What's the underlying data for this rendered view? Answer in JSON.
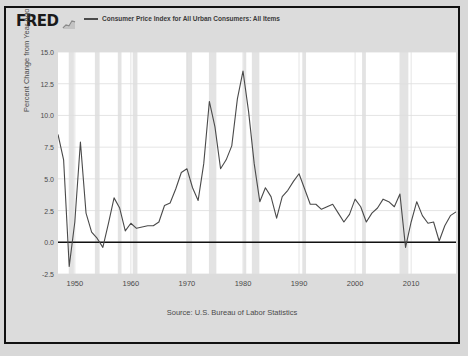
{
  "header": {
    "logo_text": "FRED",
    "logo_glyph": "chart-glyph",
    "series_label": "Consumer Price Index for All Urban Consumers: All Items"
  },
  "source": {
    "text": "Source: U.S. Bureau of Labor Statistics"
  },
  "colors": {
    "line": "#4a4a4a",
    "zero_line": "#111111",
    "grid": "#dddddd",
    "recession_band": "#e3e3e3",
    "plot_bg": "#ffffff",
    "figure_bg": "#dcdcdc",
    "text": "#4a4a4a"
  },
  "chart_data": {
    "type": "line",
    "title": "Consumer Price Index for All Urban Consumers: All Items",
    "xlabel": "",
    "ylabel": "Percent Change from Year Ago",
    "xlim": [
      1947,
      2018
    ],
    "ylim": [
      -2.5,
      15.0
    ],
    "ytick_labels": [
      "15.0",
      "12.5",
      "10.0",
      "7.5",
      "5.0",
      "2.5",
      "0.0",
      "-2.5"
    ],
    "ytick_values": [
      15.0,
      12.5,
      10.0,
      7.5,
      5.0,
      2.5,
      0.0,
      -2.5
    ],
    "xtick_labels": [
      "1950",
      "1960",
      "1970",
      "1980",
      "1990",
      "2000",
      "2010"
    ],
    "xtick_values": [
      1950,
      1960,
      1970,
      1980,
      1990,
      2000,
      2010
    ],
    "grid": true,
    "legend_position": "top",
    "zero_line": 0.0,
    "series": [
      {
        "name": "Consumer Price Index for All Urban Consumers: All Items",
        "x": [
          1947,
          1948,
          1949,
          1950,
          1951,
          1952,
          1953,
          1954,
          1955,
          1956,
          1957,
          1958,
          1959,
          1960,
          1961,
          1962,
          1963,
          1964,
          1965,
          1966,
          1967,
          1968,
          1969,
          1970,
          1971,
          1972,
          1973,
          1974,
          1975,
          1976,
          1977,
          1978,
          1979,
          1980,
          1981,
          1982,
          1983,
          1984,
          1985,
          1986,
          1987,
          1988,
          1989,
          1990,
          1991,
          1992,
          1993,
          1994,
          1995,
          1996,
          1997,
          1998,
          1999,
          2000,
          2001,
          2002,
          2003,
          2004,
          2005,
          2006,
          2007,
          2008,
          2009,
          2010,
          2011,
          2012,
          2013,
          2014,
          2015,
          2016,
          2017,
          2018
        ],
        "values": [
          8.5,
          6.5,
          -1.9,
          1.6,
          7.9,
          2.3,
          0.8,
          0.3,
          -0.4,
          1.5,
          3.5,
          2.7,
          0.9,
          1.5,
          1.1,
          1.2,
          1.3,
          1.3,
          1.6,
          2.9,
          3.1,
          4.2,
          5.5,
          5.8,
          4.3,
          3.3,
          6.2,
          11.1,
          9.1,
          5.8,
          6.5,
          7.6,
          11.3,
          13.5,
          10.3,
          6.2,
          3.2,
          4.3,
          3.6,
          1.9,
          3.6,
          4.1,
          4.8,
          5.4,
          4.2,
          3.0,
          3.0,
          2.6,
          2.8,
          3.0,
          2.3,
          1.6,
          2.2,
          3.4,
          2.8,
          1.6,
          2.3,
          2.7,
          3.4,
          3.2,
          2.8,
          3.8,
          -0.4,
          1.6,
          3.2,
          2.1,
          1.5,
          1.6,
          0.1,
          1.3,
          2.1,
          2.4
        ]
      }
    ],
    "recessions": [
      {
        "start": 1948.92,
        "end": 1949.83
      },
      {
        "start": 1953.58,
        "end": 1954.42
      },
      {
        "start": 1957.67,
        "end": 1958.33
      },
      {
        "start": 1960.33,
        "end": 1961.17
      },
      {
        "start": 1969.92,
        "end": 1970.92
      },
      {
        "start": 1973.92,
        "end": 1975.25
      },
      {
        "start": 1980.08,
        "end": 1980.58
      },
      {
        "start": 1981.58,
        "end": 1982.92
      },
      {
        "start": 1990.58,
        "end": 1991.25
      },
      {
        "start": 2001.25,
        "end": 2001.92
      },
      {
        "start": 2007.92,
        "end": 2009.5
      }
    ]
  }
}
